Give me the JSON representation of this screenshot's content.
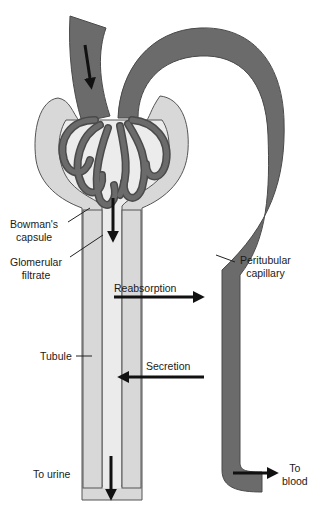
{
  "diagram": {
    "colors": {
      "vessel": "#6b6b6b",
      "vessel_outline": "#4a4a4a",
      "tubule": "#d6d6d6",
      "tubule_lumen": "#e6e6e6",
      "outline": "#555555",
      "arrow": "#111111",
      "background": "#ffffff"
    },
    "labels": {
      "bowmans_capsule_line1": "Bowman's",
      "bowmans_capsule_line2": "capsule",
      "glomerular_filtrate_line1": "Glomerular",
      "glomerular_filtrate_line2": "filtrate",
      "peritubular_capillary_line1": "Peritubular",
      "peritubular_capillary_line2": "capillary",
      "reabsorption": "Reabsorption",
      "secretion": "Secretion",
      "tubule": "Tubule",
      "to_urine": "To urine",
      "to_blood_line1": "To",
      "to_blood_line2": "blood"
    },
    "arrows": [
      {
        "name": "afferent-flow",
        "direction": "down"
      },
      {
        "name": "filtration",
        "direction": "down"
      },
      {
        "name": "reabsorption",
        "direction": "right"
      },
      {
        "name": "secretion",
        "direction": "left"
      },
      {
        "name": "to-urine",
        "direction": "down"
      },
      {
        "name": "to-blood",
        "direction": "right"
      }
    ]
  }
}
